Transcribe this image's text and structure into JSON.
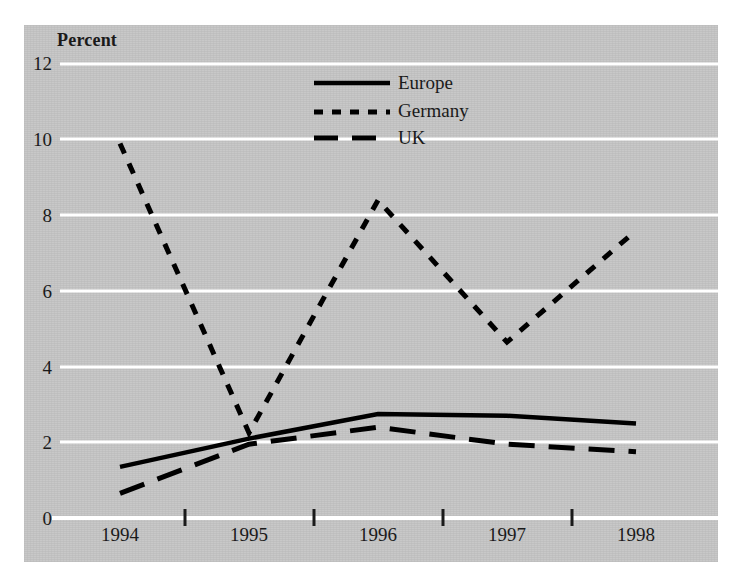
{
  "chart_data": {
    "type": "line",
    "title": "",
    "ylabel": "Percent",
    "xlabel": "",
    "categories": [
      "1994",
      "1995",
      "1996",
      "1997",
      "1998"
    ],
    "ylim": [
      0,
      12
    ],
    "yticks": [
      0,
      2,
      4,
      6,
      8,
      10,
      12
    ],
    "ytick_labels": [
      "0",
      "2",
      "4",
      "6",
      "8",
      "10",
      "12"
    ],
    "grid": "horizontal-white",
    "legend_position": "top-center",
    "series": [
      {
        "name": "Europe",
        "style": "solid",
        "color": "#000000",
        "values": [
          1.35,
          2.1,
          2.75,
          2.7,
          2.5
        ]
      },
      {
        "name": "Germany",
        "style": "dotted",
        "color": "#000000",
        "values": [
          9.9,
          2.25,
          8.4,
          4.65,
          7.6
        ]
      },
      {
        "name": "UK",
        "style": "dashed",
        "color": "#000000",
        "values": [
          0.65,
          1.95,
          2.4,
          1.95,
          1.75
        ]
      }
    ]
  },
  "axes": {
    "y_title": "Percent",
    "y_labels": [
      "12",
      "10",
      "8",
      "6",
      "4",
      "2",
      "0"
    ],
    "x_labels": [
      "1994",
      "1995",
      "1996",
      "1997",
      "1998"
    ]
  },
  "legend": {
    "entries": [
      {
        "label": "Europe",
        "style": "solid"
      },
      {
        "label": "Germany",
        "style": "dotted"
      },
      {
        "label": "UK",
        "style": "dashed"
      }
    ]
  },
  "colors": {
    "panel_background": "#c8c8c8",
    "gridline": "#ffffff",
    "line": "#000000",
    "text": "#1a1a1a",
    "page_background": "#ffffff"
  }
}
